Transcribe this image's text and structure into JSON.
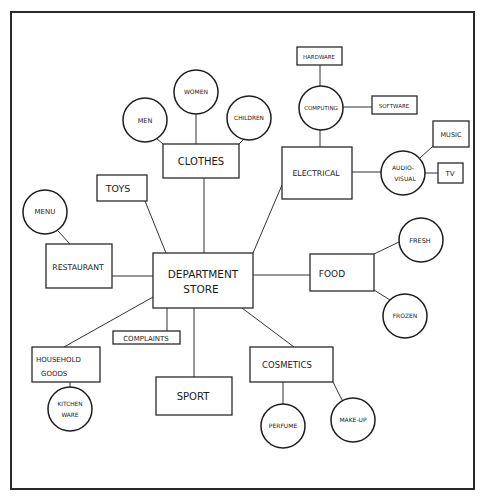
{
  "diagram": {
    "type": "hand-drawn spider diagram",
    "colors": {
      "ink": "#2a2a2a",
      "paper": "#ffffff"
    },
    "root": {
      "id": "department-store",
      "lines": [
        "DEPARTMENT",
        "STORE"
      ]
    },
    "nodes": {
      "clothes": {
        "label": "CLOTHES",
        "shape": "box"
      },
      "men": {
        "label": "MEN",
        "shape": "circle"
      },
      "women": {
        "label": "WOMEN",
        "shape": "circle"
      },
      "children": {
        "label": "CHILDREN",
        "shape": "circle"
      },
      "toys": {
        "label": "TOYS",
        "shape": "box"
      },
      "restaurant": {
        "label": "RESTAURANT",
        "shape": "box"
      },
      "menu": {
        "label": "MENU",
        "shape": "circle"
      },
      "electrical": {
        "label": "ELECTRICAL",
        "shape": "box"
      },
      "computing": {
        "label": "COMPUTING",
        "shape": "circle"
      },
      "hardware": {
        "label": "HARDWARE",
        "shape": "box"
      },
      "software": {
        "label": "SOFTWARE",
        "shape": "box"
      },
      "audio_visual": {
        "lines": [
          "AUDIO-",
          "VISUAL"
        ],
        "shape": "circle"
      },
      "music": {
        "label": "MUSIC",
        "shape": "box"
      },
      "tv": {
        "label": "TV",
        "shape": "box"
      },
      "food": {
        "label": "FOOD",
        "shape": "box"
      },
      "fresh": {
        "label": "FRESH",
        "shape": "circle"
      },
      "frozen": {
        "label": "FROZEN",
        "shape": "circle"
      },
      "complaints": {
        "label": "COMPLAINTS",
        "shape": "box"
      },
      "household_goods": {
        "lines": [
          "HOUSEHOLD",
          "GOODS"
        ],
        "shape": "box"
      },
      "kitchen_ware": {
        "lines": [
          "KITCHEN",
          "WARE"
        ],
        "shape": "circle"
      },
      "sport": {
        "label": "SPORT",
        "shape": "box"
      },
      "cosmetics": {
        "label": "COSMETICS",
        "shape": "box"
      },
      "perfume": {
        "label": "PERFUME",
        "shape": "circle"
      },
      "make_up": {
        "label": "MAKE-UP",
        "shape": "circle"
      }
    },
    "edges": [
      [
        "department-store",
        "clothes"
      ],
      [
        "department-store",
        "toys"
      ],
      [
        "department-store",
        "restaurant"
      ],
      [
        "department-store",
        "electrical"
      ],
      [
        "department-store",
        "food"
      ],
      [
        "department-store",
        "complaints"
      ],
      [
        "department-store",
        "household_goods"
      ],
      [
        "department-store",
        "sport"
      ],
      [
        "department-store",
        "cosmetics"
      ],
      [
        "clothes",
        "men"
      ],
      [
        "clothes",
        "women"
      ],
      [
        "clothes",
        "children"
      ],
      [
        "restaurant",
        "menu"
      ],
      [
        "electrical",
        "computing"
      ],
      [
        "electrical",
        "audio_visual"
      ],
      [
        "computing",
        "hardware"
      ],
      [
        "computing",
        "software"
      ],
      [
        "audio_visual",
        "music"
      ],
      [
        "audio_visual",
        "tv"
      ],
      [
        "food",
        "fresh"
      ],
      [
        "food",
        "frozen"
      ],
      [
        "household_goods",
        "kitchen_ware"
      ],
      [
        "cosmetics",
        "perfume"
      ],
      [
        "cosmetics",
        "make_up"
      ]
    ]
  }
}
